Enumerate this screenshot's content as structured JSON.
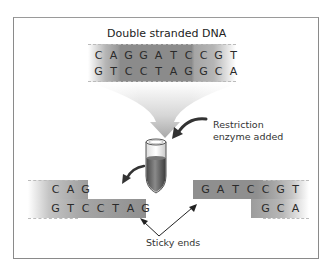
{
  "diagram": {
    "title": "Double stranded DNA",
    "dna_top_strand": [
      "C",
      "A",
      "G",
      "G",
      "A",
      "T",
      "C",
      "C",
      "G",
      "T"
    ],
    "dna_bottom_strand": [
      "G",
      "T",
      "C",
      "C",
      "T",
      "A",
      "G",
      "G",
      "C",
      "A"
    ],
    "enzyme_label_line1": "Restriction",
    "enzyme_label_line2": "enzyme added",
    "left_fragment": {
      "top": [
        "C",
        "A",
        "G"
      ],
      "bottom": [
        "G",
        "T",
        "C",
        "C",
        "T",
        "A",
        "G"
      ]
    },
    "right_fragment": {
      "top": [
        "G",
        "A",
        "T",
        "C",
        "C",
        "G",
        "T"
      ],
      "bottom": [
        "G",
        "C",
        "A"
      ]
    },
    "sticky_ends_label": "Sticky ends",
    "colors": {
      "dark_band": "#8c8c8c",
      "mid_band": "#a8a8a8",
      "frame": "#8a8a8a",
      "tube_liquid": "#6e6e6e"
    }
  }
}
